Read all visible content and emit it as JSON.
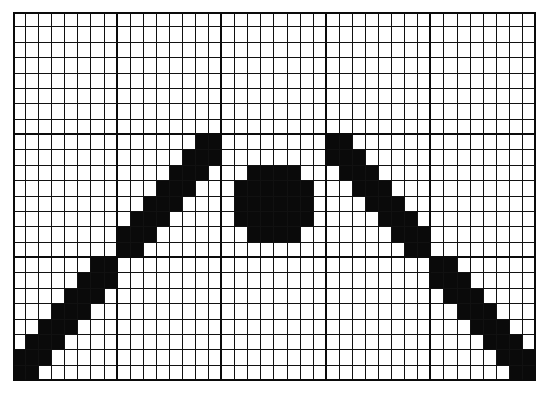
{
  "figure": {
    "type": "pixel-grid",
    "columns": 40,
    "rows": 24,
    "major_every_cols": 8,
    "major_every_rows": 8,
    "colors": {
      "filled": "#0a0a0a",
      "empty": "#ffffff",
      "grid_line": "#111111"
    },
    "filled_cells_by_row": {
      "8": [
        14,
        15,
        24,
        25
      ],
      "9": [
        13,
        14,
        15,
        24,
        25,
        26
      ],
      "10": [
        12,
        13,
        14,
        18,
        19,
        20,
        21,
        25,
        26,
        27
      ],
      "11": [
        11,
        12,
        13,
        17,
        18,
        19,
        20,
        21,
        22,
        26,
        27,
        28
      ],
      "12": [
        10,
        11,
        12,
        17,
        18,
        19,
        20,
        21,
        22,
        27,
        28,
        29
      ],
      "13": [
        9,
        10,
        11,
        17,
        18,
        19,
        20,
        21,
        22,
        28,
        29,
        30
      ],
      "14": [
        8,
        9,
        10,
        18,
        19,
        20,
        21,
        29,
        30,
        31
      ],
      "15": [
        8,
        9,
        30,
        31
      ],
      "16": [
        6,
        7,
        32,
        33
      ],
      "17": [
        5,
        6,
        7,
        32,
        33,
        34
      ],
      "18": [
        4,
        5,
        6,
        33,
        34,
        35
      ],
      "19": [
        3,
        4,
        5,
        34,
        35,
        36
      ],
      "20": [
        2,
        3,
        4,
        35,
        36,
        37
      ],
      "21": [
        1,
        2,
        3,
        36,
        37,
        38
      ],
      "22": [
        0,
        1,
        2,
        37,
        38,
        39
      ],
      "23": [
        0,
        1,
        38,
        39
      ]
    },
    "shapes": [
      {
        "name": "left-diagonal-line",
        "from_cell": [
          0,
          23
        ],
        "to_cell": [
          15,
          8
        ]
      },
      {
        "name": "center-dot",
        "bounds_cols": [
          17,
          22
        ],
        "bounds_rows": [
          10,
          14
        ]
      },
      {
        "name": "right-diagonal-line",
        "from_cell": [
          24,
          8
        ],
        "to_cell": [
          39,
          23
        ]
      }
    ]
  }
}
